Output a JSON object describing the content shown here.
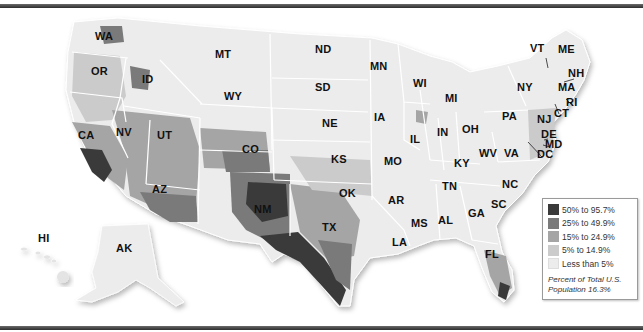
{
  "map": {
    "type": "choropleth",
    "region": "United States (by county)",
    "measure": "Percent of population",
    "total": {
      "label": "Percent of Total U.S. Population 16.3%",
      "line1": "Percent of Total U.S.",
      "line2": "Population 16.3%",
      "value_pct": 16.3
    }
  },
  "legend": {
    "items": [
      {
        "label": "50% to 95.7%",
        "color": "#3a3a3a",
        "min": 50,
        "max": 95.7
      },
      {
        "label": "25% to 49.9%",
        "color": "#7a7a7a",
        "min": 25,
        "max": 49.9
      },
      {
        "label": "15% to 24.9%",
        "color": "#a5a5a5",
        "min": 15,
        "max": 24.9
      },
      {
        "label": "5% to 14.9%",
        "color": "#cbcbcb",
        "min": 5,
        "max": 14.9
      },
      {
        "label": "Less than 5%",
        "color": "#ececec",
        "min": 0,
        "max": 5
      }
    ],
    "note_line1": "Percent of Total U.S.",
    "note_line2": "Population 16.3%"
  },
  "states": [
    {
      "abbr": "WA",
      "x": 103,
      "y": 37
    },
    {
      "abbr": "OR",
      "x": 99,
      "y": 72
    },
    {
      "abbr": "CA",
      "x": 86,
      "y": 136
    },
    {
      "abbr": "NV",
      "x": 124,
      "y": 133
    },
    {
      "abbr": "ID",
      "x": 150,
      "y": 80
    },
    {
      "abbr": "MT",
      "x": 223,
      "y": 55
    },
    {
      "abbr": "WY",
      "x": 232,
      "y": 97
    },
    {
      "abbr": "UT",
      "x": 165,
      "y": 136
    },
    {
      "abbr": "AZ",
      "x": 160,
      "y": 190
    },
    {
      "abbr": "CO",
      "x": 250,
      "y": 150
    },
    {
      "abbr": "NM",
      "x": 262,
      "y": 210
    },
    {
      "abbr": "ND",
      "x": 323,
      "y": 50
    },
    {
      "abbr": "SD",
      "x": 323,
      "y": 88
    },
    {
      "abbr": "NE",
      "x": 330,
      "y": 124
    },
    {
      "abbr": "KS",
      "x": 339,
      "y": 160
    },
    {
      "abbr": "OK",
      "x": 347,
      "y": 194
    },
    {
      "abbr": "TX",
      "x": 330,
      "y": 228
    },
    {
      "abbr": "MN",
      "x": 378,
      "y": 67
    },
    {
      "abbr": "IA",
      "x": 382,
      "y": 118
    },
    {
      "abbr": "MO",
      "x": 392,
      "y": 162
    },
    {
      "abbr": "AR",
      "x": 396,
      "y": 201
    },
    {
      "abbr": "LA",
      "x": 400,
      "y": 243
    },
    {
      "abbr": "WI",
      "x": 421,
      "y": 84
    },
    {
      "abbr": "IL",
      "x": 418,
      "y": 140
    },
    {
      "abbr": "MS",
      "x": 419,
      "y": 224
    },
    {
      "abbr": "MI",
      "x": 453,
      "y": 99
    },
    {
      "abbr": "IN",
      "x": 445,
      "y": 133
    },
    {
      "abbr": "KY",
      "x": 462,
      "y": 164
    },
    {
      "abbr": "TN",
      "x": 450,
      "y": 187
    },
    {
      "abbr": "AL",
      "x": 446,
      "y": 221
    },
    {
      "abbr": "OH",
      "x": 470,
      "y": 130
    },
    {
      "abbr": "GA",
      "x": 476,
      "y": 214
    },
    {
      "abbr": "FL",
      "x": 493,
      "y": 255
    },
    {
      "abbr": "WV",
      "x": 487,
      "y": 154
    },
    {
      "abbr": "VA",
      "x": 512,
      "y": 154
    },
    {
      "abbr": "NC",
      "x": 510,
      "y": 185
    },
    {
      "abbr": "SC",
      "x": 499,
      "y": 205
    },
    {
      "abbr": "PA",
      "x": 510,
      "y": 117
    },
    {
      "abbr": "NY",
      "x": 525,
      "y": 88
    },
    {
      "abbr": "VT",
      "x": 538,
      "y": 49
    },
    {
      "abbr": "ME",
      "x": 566,
      "y": 50
    },
    {
      "abbr": "NH",
      "x": 576,
      "y": 74
    },
    {
      "abbr": "MA",
      "x": 566,
      "y": 88
    },
    {
      "abbr": "RI",
      "x": 574,
      "y": 103
    },
    {
      "abbr": "CT",
      "x": 562,
      "y": 114
    },
    {
      "abbr": "NJ",
      "x": 545,
      "y": 120
    },
    {
      "abbr": "DE",
      "x": 549,
      "y": 135
    },
    {
      "abbr": "MD",
      "x": 553,
      "y": 145
    },
    {
      "abbr": "DC",
      "x": 545,
      "y": 155
    },
    {
      "abbr": "HI",
      "x": 46,
      "y": 239
    },
    {
      "abbr": "AK",
      "x": 124,
      "y": 249
    }
  ]
}
